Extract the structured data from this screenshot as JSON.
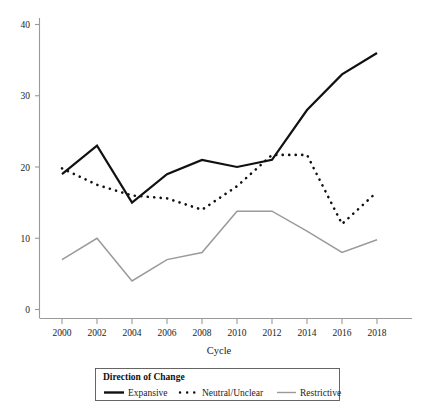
{
  "chart_data": {
    "type": "line",
    "title": "",
    "xlabel": "Cycle",
    "ylabel": "",
    "x": [
      2000,
      2002,
      2004,
      2006,
      2008,
      2010,
      2012,
      2014,
      2016,
      2018
    ],
    "categories": [
      "2000",
      "2002",
      "2004",
      "2006",
      "2008",
      "2010",
      "2012",
      "2014",
      "2016",
      "2018"
    ],
    "xlim": [
      1999,
      2019
    ],
    "ylim": [
      0,
      41
    ],
    "xticks": [
      "2000",
      "2002",
      "2004",
      "2006",
      "2008",
      "2010",
      "2012",
      "2014",
      "2016",
      "2018"
    ],
    "yticks": [
      "0",
      "10",
      "20",
      "30",
      "40"
    ],
    "grid": false,
    "legend_position": "bottom",
    "legend_title": "Direction of Change",
    "series": [
      {
        "name": "Expansive",
        "style": "solid-thick",
        "color": "#111111",
        "values": [
          19.0,
          23.0,
          15.0,
          19.0,
          21.0,
          20.0,
          21.0,
          28.0,
          33.0,
          36.0
        ]
      },
      {
        "name": "Neutral/Unclear",
        "style": "dotted",
        "color": "#111111",
        "values": [
          19.8,
          17.5,
          16.0,
          15.6,
          14.0,
          17.3,
          21.7,
          21.7,
          12.0,
          16.5
        ]
      },
      {
        "name": "Restrictive",
        "style": "solid-thin",
        "color": "#9a9a9a",
        "values": [
          7.0,
          10.0,
          4.0,
          7.0,
          8.0,
          13.8,
          13.8,
          11.0,
          8.0,
          9.8
        ]
      }
    ]
  },
  "axes": {
    "y_tick_labels": [
      "40",
      "30",
      "20",
      "10",
      "0"
    ],
    "x_tick_labels": [
      "2000",
      "2002",
      "2004",
      "2006",
      "2008",
      "2010",
      "2012",
      "2014",
      "2016",
      "2018"
    ],
    "x_axis_title": "Cycle"
  },
  "legend": {
    "title": "Direction of Change",
    "entries": [
      {
        "label": "Expansive",
        "marker": "solid-thick-line-icon"
      },
      {
        "label": "Neutral/Unclear",
        "marker": "dotted-line-icon"
      },
      {
        "label": "Restrictive",
        "marker": "solid-thin-grey-line-icon"
      }
    ]
  },
  "colors": {
    "expansive": "#111111",
    "neutral": "#111111",
    "restrictive": "#9a9a9a",
    "axis": "#9a9a9a",
    "background": "#ffffff"
  }
}
